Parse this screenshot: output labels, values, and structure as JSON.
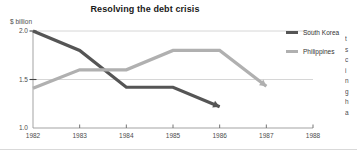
{
  "chart_data": {
    "type": "line",
    "title": "Resolving the debt crisis",
    "xlabel": "",
    "ylabel": "$ billion",
    "unit_label": "$ billion",
    "x": [
      1982,
      1983,
      1984,
      1985,
      1986,
      1987,
      1988
    ],
    "xtick_labels": [
      "1982",
      "1983",
      "1984",
      "1985",
      "1986",
      "1987",
      "1988"
    ],
    "ytick_labels": [
      "1.0",
      "1.5",
      "2.0"
    ],
    "yticks": [
      1.0,
      1.5,
      2.0
    ],
    "ylim": [
      1.0,
      2.0
    ],
    "xlim": [
      1982,
      1988
    ],
    "grid": true,
    "grid_lines": [
      1.5,
      2.0
    ],
    "legend_position": "right",
    "series": [
      {
        "name": "South Korea",
        "color": "#555555",
        "width": 3.2,
        "arrow_end": true,
        "x": [
          1982,
          1983,
          1984,
          1985,
          1986
        ],
        "values": [
          2.0,
          1.8,
          1.42,
          1.42,
          1.22
        ]
      },
      {
        "name": "Philippines",
        "color": "#b0b0b0",
        "width": 3.2,
        "arrow_end": true,
        "x": [
          1982,
          1983,
          1984,
          1985,
          1986,
          1987
        ],
        "values": [
          1.41,
          1.6,
          1.6,
          1.8,
          1.8,
          1.43
        ]
      }
    ]
  },
  "legend": {
    "items": [
      {
        "label": "South Korea",
        "color": "#555555"
      },
      {
        "label": "Philippines",
        "color": "#b0b0b0"
      }
    ]
  },
  "side_column": {
    "lines": [
      "t",
      "s",
      "c",
      "i",
      "n",
      "g",
      "h",
      "",
      "a"
    ]
  }
}
